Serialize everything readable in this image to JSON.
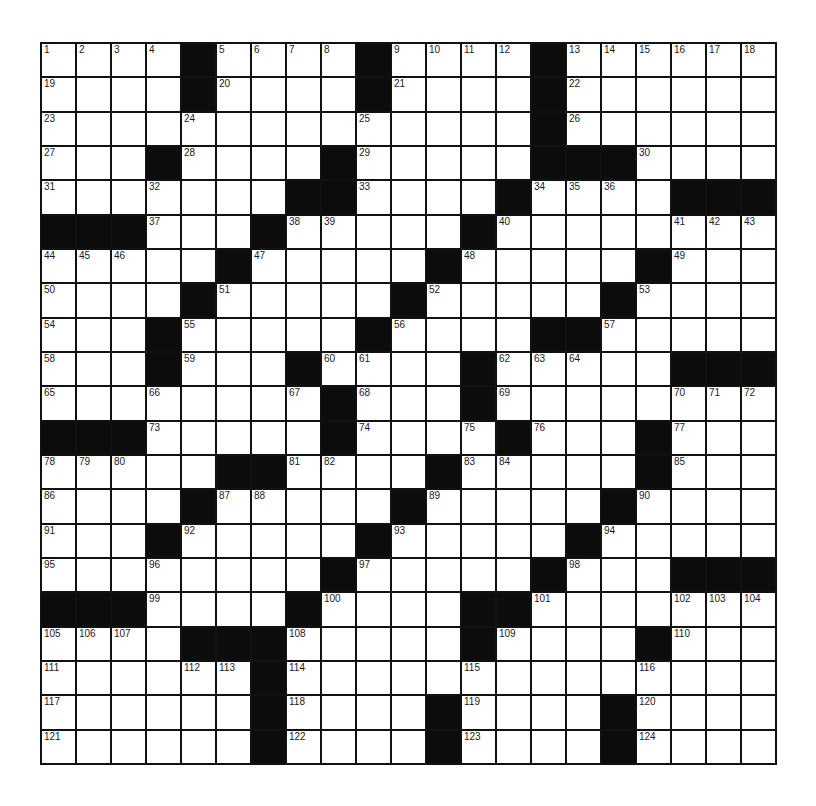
{
  "puzzle": {
    "rows": 21,
    "cols": 21,
    "colors": {
      "block": "#0c0c0c",
      "cell": "#ffffff",
      "border": "#111111"
    },
    "layout": [
      "....#....#....#......",
      "....#....#....#......",
      "..............#......",
      "...#....#.....###....",
      ".......##....#....###",
      "###...#.....#........",
      ".....#.....#.....#...",
      "....#.....#.....#....",
      "...#.....#....##.....",
      "...#...#....#.....###",
      "........#...#........",
      "###.....#....#...#...",
      ".....##....#.....#...",
      "....#.....#.....#....",
      "...#.....#.....#.....",
      "........#.....#...###",
      "###....#....##.......",
      "....###.....#....#...",
      "......#..............",
      "......#....#....#....",
      "......#....#....#...."
    ],
    "numbers": [
      {
        "r": 0,
        "c": 0,
        "n": "1"
      },
      {
        "r": 0,
        "c": 1,
        "n": "2"
      },
      {
        "r": 0,
        "c": 2,
        "n": "3"
      },
      {
        "r": 0,
        "c": 3,
        "n": "4"
      },
      {
        "r": 0,
        "c": 5,
        "n": "5"
      },
      {
        "r": 0,
        "c": 6,
        "n": "6"
      },
      {
        "r": 0,
        "c": 7,
        "n": "7"
      },
      {
        "r": 0,
        "c": 8,
        "n": "8"
      },
      {
        "r": 0,
        "c": 10,
        "n": "9"
      },
      {
        "r": 0,
        "c": 11,
        "n": "10"
      },
      {
        "r": 0,
        "c": 12,
        "n": "11"
      },
      {
        "r": 0,
        "c": 13,
        "n": "12"
      },
      {
        "r": 0,
        "c": 15,
        "n": "13"
      },
      {
        "r": 0,
        "c": 16,
        "n": "14"
      },
      {
        "r": 0,
        "c": 17,
        "n": "15"
      },
      {
        "r": 0,
        "c": 18,
        "n": "16"
      },
      {
        "r": 0,
        "c": 19,
        "n": "17"
      },
      {
        "r": 0,
        "c": 20,
        "n": "18"
      },
      {
        "r": 1,
        "c": 0,
        "n": "19"
      },
      {
        "r": 1,
        "c": 5,
        "n": "20"
      },
      {
        "r": 1,
        "c": 10,
        "n": "21"
      },
      {
        "r": 1,
        "c": 15,
        "n": "22"
      },
      {
        "r": 2,
        "c": 0,
        "n": "23"
      },
      {
        "r": 2,
        "c": 4,
        "n": "24"
      },
      {
        "r": 2,
        "c": 9,
        "n": "25"
      },
      {
        "r": 2,
        "c": 15,
        "n": "26"
      },
      {
        "r": 3,
        "c": 0,
        "n": "27"
      },
      {
        "r": 3,
        "c": 4,
        "n": "28"
      },
      {
        "r": 3,
        "c": 9,
        "n": "29"
      },
      {
        "r": 3,
        "c": 17,
        "n": "30"
      },
      {
        "r": 4,
        "c": 0,
        "n": "31"
      },
      {
        "r": 4,
        "c": 3,
        "n": "32"
      },
      {
        "r": 4,
        "c": 9,
        "n": "33"
      },
      {
        "r": 4,
        "c": 14,
        "n": "34"
      },
      {
        "r": 4,
        "c": 15,
        "n": "35"
      },
      {
        "r": 4,
        "c": 16,
        "n": "36"
      },
      {
        "r": 5,
        "c": 3,
        "n": "37"
      },
      {
        "r": 5,
        "c": 7,
        "n": "38"
      },
      {
        "r": 5,
        "c": 8,
        "n": "39"
      },
      {
        "r": 5,
        "c": 13,
        "n": "40"
      },
      {
        "r": 5,
        "c": 18,
        "n": "41"
      },
      {
        "r": 5,
        "c": 19,
        "n": "42"
      },
      {
        "r": 5,
        "c": 20,
        "n": "43"
      },
      {
        "r": 6,
        "c": 0,
        "n": "44"
      },
      {
        "r": 6,
        "c": 1,
        "n": "45"
      },
      {
        "r": 6,
        "c": 2,
        "n": "46"
      },
      {
        "r": 6,
        "c": 6,
        "n": "47"
      },
      {
        "r": 6,
        "c": 12,
        "n": "48"
      },
      {
        "r": 6,
        "c": 18,
        "n": "49"
      },
      {
        "r": 7,
        "c": 0,
        "n": "50"
      },
      {
        "r": 7,
        "c": 5,
        "n": "51"
      },
      {
        "r": 7,
        "c": 11,
        "n": "52"
      },
      {
        "r": 7,
        "c": 17,
        "n": "53"
      },
      {
        "r": 8,
        "c": 0,
        "n": "54"
      },
      {
        "r": 8,
        "c": 4,
        "n": "55"
      },
      {
        "r": 8,
        "c": 10,
        "n": "56"
      },
      {
        "r": 8,
        "c": 16,
        "n": "57"
      },
      {
        "r": 9,
        "c": 0,
        "n": "58"
      },
      {
        "r": 9,
        "c": 4,
        "n": "59"
      },
      {
        "r": 9,
        "c": 8,
        "n": "60"
      },
      {
        "r": 9,
        "c": 9,
        "n": "61"
      },
      {
        "r": 9,
        "c": 13,
        "n": "62"
      },
      {
        "r": 9,
        "c": 14,
        "n": "63"
      },
      {
        "r": 9,
        "c": 15,
        "n": "64"
      },
      {
        "r": 10,
        "c": 0,
        "n": "65"
      },
      {
        "r": 10,
        "c": 3,
        "n": "66"
      },
      {
        "r": 10,
        "c": 7,
        "n": "67"
      },
      {
        "r": 10,
        "c": 9,
        "n": "68"
      },
      {
        "r": 10,
        "c": 13,
        "n": "69"
      },
      {
        "r": 10,
        "c": 18,
        "n": "70"
      },
      {
        "r": 10,
        "c": 19,
        "n": "71"
      },
      {
        "r": 10,
        "c": 20,
        "n": "72"
      },
      {
        "r": 11,
        "c": 3,
        "n": "73"
      },
      {
        "r": 11,
        "c": 9,
        "n": "74"
      },
      {
        "r": 11,
        "c": 12,
        "n": "75"
      },
      {
        "r": 11,
        "c": 14,
        "n": "76"
      },
      {
        "r": 11,
        "c": 18,
        "n": "77"
      },
      {
        "r": 12,
        "c": 0,
        "n": "78"
      },
      {
        "r": 12,
        "c": 1,
        "n": "79"
      },
      {
        "r": 12,
        "c": 2,
        "n": "80"
      },
      {
        "r": 12,
        "c": 7,
        "n": "81"
      },
      {
        "r": 12,
        "c": 8,
        "n": "82"
      },
      {
        "r": 12,
        "c": 12,
        "n": "83"
      },
      {
        "r": 12,
        "c": 13,
        "n": "84"
      },
      {
        "r": 12,
        "c": 18,
        "n": "85"
      },
      {
        "r": 13,
        "c": 0,
        "n": "86"
      },
      {
        "r": 13,
        "c": 5,
        "n": "87"
      },
      {
        "r": 13,
        "c": 6,
        "n": "88"
      },
      {
        "r": 13,
        "c": 11,
        "n": "89"
      },
      {
        "r": 13,
        "c": 17,
        "n": "90"
      },
      {
        "r": 14,
        "c": 0,
        "n": "91"
      },
      {
        "r": 14,
        "c": 4,
        "n": "92"
      },
      {
        "r": 14,
        "c": 10,
        "n": "93"
      },
      {
        "r": 14,
        "c": 16,
        "n": "94"
      },
      {
        "r": 15,
        "c": 0,
        "n": "95"
      },
      {
        "r": 15,
        "c": 3,
        "n": "96"
      },
      {
        "r": 15,
        "c": 9,
        "n": "97"
      },
      {
        "r": 15,
        "c": 15,
        "n": "98"
      },
      {
        "r": 16,
        "c": 3,
        "n": "99"
      },
      {
        "r": 16,
        "c": 8,
        "n": "100"
      },
      {
        "r": 16,
        "c": 14,
        "n": "101"
      },
      {
        "r": 16,
        "c": 18,
        "n": "102"
      },
      {
        "r": 16,
        "c": 19,
        "n": "103"
      },
      {
        "r": 16,
        "c": 20,
        "n": "104"
      },
      {
        "r": 17,
        "c": 0,
        "n": "105"
      },
      {
        "r": 17,
        "c": 1,
        "n": "106"
      },
      {
        "r": 17,
        "c": 2,
        "n": "107"
      },
      {
        "r": 17,
        "c": 7,
        "n": "108"
      },
      {
        "r": 17,
        "c": 13,
        "n": "109"
      },
      {
        "r": 17,
        "c": 18,
        "n": "110"
      },
      {
        "r": 18,
        "c": 0,
        "n": "111"
      },
      {
        "r": 18,
        "c": 4,
        "n": "112"
      },
      {
        "r": 18,
        "c": 5,
        "n": "113"
      },
      {
        "r": 18,
        "c": 7,
        "n": "114"
      },
      {
        "r": 18,
        "c": 12,
        "n": "115"
      },
      {
        "r": 18,
        "c": 17,
        "n": "116"
      },
      {
        "r": 19,
        "c": 0,
        "n": "117"
      },
      {
        "r": 19,
        "c": 7,
        "n": "118"
      },
      {
        "r": 19,
        "c": 12,
        "n": "119"
      },
      {
        "r": 19,
        "c": 17,
        "n": "120"
      },
      {
        "r": 20,
        "c": 0,
        "n": "121"
      },
      {
        "r": 20,
        "c": 7,
        "n": "122"
      },
      {
        "r": 20,
        "c": 12,
        "n": "123"
      },
      {
        "r": 20,
        "c": 17,
        "n": "124"
      }
    ],
    "entries": {}
  }
}
